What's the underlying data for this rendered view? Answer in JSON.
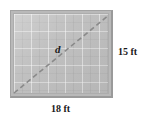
{
  "figure": {
    "type": "geometry-diagram",
    "shape": "rectangle",
    "labels": {
      "diagonal": "d",
      "height": "15 ft",
      "width": "18 ft"
    },
    "colors": {
      "fill": "#bdbdbd",
      "border": "#9a9a9a",
      "diagonal": "#8a8a8a",
      "text": "#1a1a1a",
      "background": "#ffffff"
    },
    "measurements": {
      "width_value": 18,
      "height_value": 15,
      "unit": "ft",
      "diagonal_symbol": "d"
    },
    "diagonal_style": "dashed",
    "diagonal_from": "bottom-left",
    "diagonal_to": "top-right"
  }
}
